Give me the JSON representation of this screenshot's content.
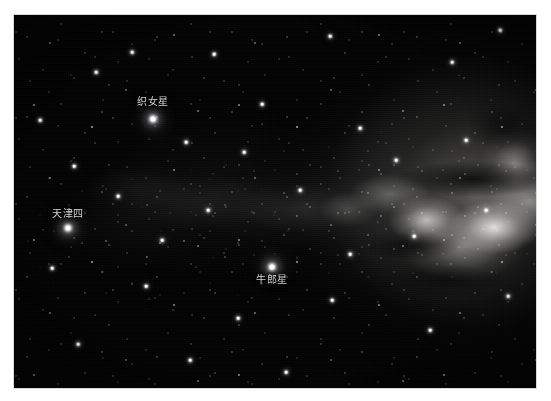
{
  "photo": {
    "type": "astrophotograph",
    "subject": "Summer Triangle and the Milky Way",
    "background_color": "#000000",
    "page_background_color": "#ffffff",
    "label_color": "#d2d2d2"
  },
  "labels": {
    "vega": "织女星",
    "deneb": "天津四",
    "altair": "牛郎星"
  },
  "named_stars": [
    {
      "key": "vega",
      "label": "织女星",
      "x": 153,
      "y": 119,
      "label_x": 153,
      "label_y": 96
    },
    {
      "key": "deneb",
      "label": "天津四",
      "x": 68,
      "y": 228,
      "label_x": 68,
      "label_y": 208
    },
    {
      "key": "altair",
      "label": "牛郎星",
      "x": 272,
      "y": 267,
      "label_x": 272,
      "label_y": 274
    }
  ],
  "bright_stars": [
    {
      "x": 96,
      "y": 72
    },
    {
      "x": 214,
      "y": 54
    },
    {
      "x": 330,
      "y": 36
    },
    {
      "x": 452,
      "y": 62
    },
    {
      "x": 500,
      "y": 30
    },
    {
      "x": 40,
      "y": 120
    },
    {
      "x": 186,
      "y": 142
    },
    {
      "x": 262,
      "y": 104
    },
    {
      "x": 360,
      "y": 128
    },
    {
      "x": 118,
      "y": 196
    },
    {
      "x": 208,
      "y": 210
    },
    {
      "x": 300,
      "y": 190
    },
    {
      "x": 414,
      "y": 236
    },
    {
      "x": 486,
      "y": 210
    },
    {
      "x": 52,
      "y": 268
    },
    {
      "x": 146,
      "y": 286
    },
    {
      "x": 238,
      "y": 318
    },
    {
      "x": 332,
      "y": 300
    },
    {
      "x": 430,
      "y": 330
    },
    {
      "x": 508,
      "y": 296
    },
    {
      "x": 78,
      "y": 344
    },
    {
      "x": 190,
      "y": 360
    },
    {
      "x": 286,
      "y": 372
    },
    {
      "x": 396,
      "y": 160
    },
    {
      "x": 162,
      "y": 240
    },
    {
      "x": 244,
      "y": 152
    },
    {
      "x": 74,
      "y": 166
    },
    {
      "x": 350,
      "y": 254
    },
    {
      "x": 466,
      "y": 140
    },
    {
      "x": 132,
      "y": 52
    }
  ]
}
